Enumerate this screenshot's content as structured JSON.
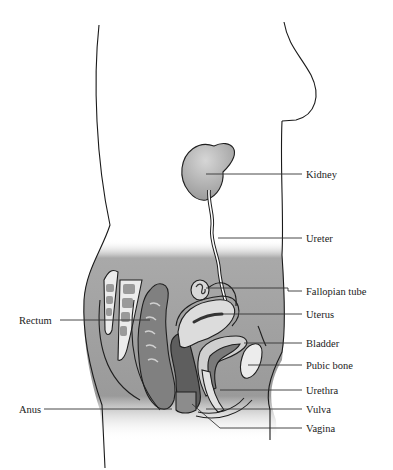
{
  "diagram": {
    "labels": {
      "kidney": "Kidney",
      "ureter": "Ureter",
      "fallopian_tube": "Fallopian tube",
      "uterus": "Uterus",
      "bladder": "Bladder",
      "pubic_bone": "Pubic bone",
      "urethra": "Urethra",
      "vulva": "Vulva",
      "vagina": "Vagina",
      "rectum": "Rectum",
      "anus": "Anus"
    },
    "colors": {
      "background": "#ffffff",
      "pelvis_shade": "#9a9a9a",
      "kidney": "#b0b0b0",
      "organ_light": "#d8d8d8",
      "organ_mid": "#8c8c8c",
      "organ_dark": "#5e5e5e",
      "bone_light": "#ececec",
      "outline": "#1a1a1a"
    }
  }
}
